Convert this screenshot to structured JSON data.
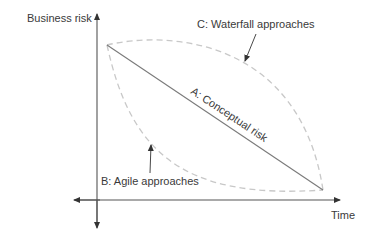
{
  "diagram": {
    "y_axis_label": "Business risk",
    "x_axis_label": "Time",
    "series": [
      {
        "id": "A",
        "label": "A: Conceptual risk",
        "style": "solid",
        "shape": "straight line"
      },
      {
        "id": "B",
        "label": "B: Agile approaches",
        "style": "dashed",
        "shape": "convex curve below line"
      },
      {
        "id": "C",
        "label": "C: Waterfall approaches",
        "style": "dashed",
        "shape": "concave curve above line"
      }
    ],
    "colors": {
      "axis": "#555555",
      "line_a": "#7a7a7a",
      "dashed": "#c8c8c8",
      "text": "#3a3a3a"
    }
  }
}
